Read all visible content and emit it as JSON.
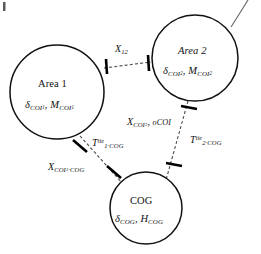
{
  "figure": {
    "type": "three-area-power-system-schematic",
    "background_color": "#ffffff",
    "line_color": "#111111",
    "tie_line_color": "#4a4a4a"
  },
  "nodes": [
    {
      "id": "area1",
      "name": "Area 1",
      "variables": "δ, M",
      "delta_symbol": "δ",
      "delta_subscript": "COI",
      "delta_subscript_index": "1",
      "m_symbol": "M",
      "m_subscript": "COI",
      "m_subscript_index": "1",
      "separator": ",",
      "cx": 57,
      "cy": 92,
      "r": 47
    },
    {
      "id": "area2",
      "name": "Area 2",
      "variables": "δ, M",
      "delta_symbol": "δ",
      "delta_subscript": "COI",
      "delta_subscript_index": "2",
      "m_symbol": "M",
      "m_subscript": "COI",
      "m_subscript_index": "2",
      "separator": ",",
      "cx": 195,
      "cy": 58,
      "r": 43
    },
    {
      "id": "cog",
      "name": "COG",
      "variables": "δ, H",
      "delta_symbol": "δ",
      "delta_subscript": "COG",
      "h_symbol": "H",
      "h_subscript": "COG",
      "separator": ",",
      "cx": 146,
      "cy": 208,
      "r": 36
    }
  ],
  "ties": [
    {
      "id": "x12",
      "from": "area1",
      "to": "area2",
      "label_symbol": "X",
      "label_subscript": "12",
      "x1": 104,
      "y1": 68,
      "x2": 151,
      "y2": 62
    },
    {
      "id": "t1cog",
      "from": "area1",
      "to": "cog",
      "label_symbol": "T",
      "label_superscript": "tie",
      "label_subscript": "1·COG",
      "x1": 80,
      "y1": 135,
      "x2": 122,
      "y2": 183
    },
    {
      "id": "t2cog",
      "from": "area2",
      "to": "cog",
      "label_symbol": "T",
      "label_superscript": "tie",
      "label_subscript": "2·COG",
      "x1": 188,
      "y1": 101,
      "x2": 167,
      "y2": 180
    }
  ],
  "reactance_labels": [
    {
      "id": "x-coi1-cog",
      "symbol": "X",
      "subscript": "COI",
      "subscript_index": "1",
      "subscript_tail": "·COG"
    },
    {
      "id": "x-coi2-ocoi",
      "symbol": "X",
      "subscript": "COI",
      "subscript_index": "2",
      "separator": ",",
      "second_term": "oCOI"
    }
  ],
  "breakers": [
    {
      "id": "breaker-x12-left",
      "cx": 106,
      "cy": 66,
      "angle": 8
    },
    {
      "id": "breaker-x12-right",
      "cx": 148,
      "cy": 63,
      "angle": 8
    },
    {
      "id": "breaker-t1-upper",
      "cx": 80,
      "cy": 146,
      "angle": -40
    },
    {
      "id": "breaker-t1-lower",
      "cx": 114,
      "cy": 172,
      "angle": -40
    },
    {
      "id": "breaker-t2-upper",
      "cx": 189,
      "cy": 108,
      "angle": 80
    },
    {
      "id": "breaker-t2-lower",
      "cx": 174,
      "cy": 165,
      "angle": 80
    }
  ]
}
